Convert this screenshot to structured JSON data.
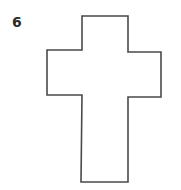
{
  "figure": {
    "number_label": "6",
    "shape": "cross-outline",
    "stroke_color": "#4a4a4a",
    "fill_color": "#ffffff",
    "points": "82,16 128,16 128,52 161,52 161,97 128,97 128,182 81,182 82,95 47,95 47,50 82,50"
  }
}
